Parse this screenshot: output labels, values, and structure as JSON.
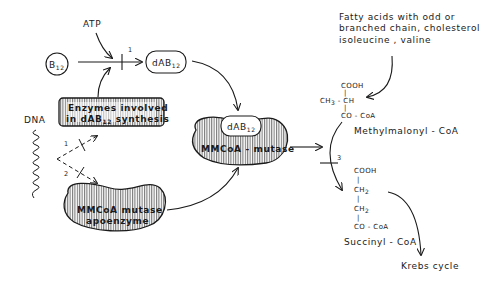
{
  "diagram": {
    "nodes": {
      "atp": {
        "label": "ATP"
      },
      "b12": {
        "label": "B",
        "sub": "12"
      },
      "dab12_top": {
        "label": "dAB",
        "sub": "12"
      },
      "enzymes": {
        "line1": "Enzymes involved",
        "line2_pre": "in dAB",
        "line2_sub": "12",
        "line2_post": " synthesis"
      },
      "dna": {
        "label": "DNA"
      },
      "mmcoa_mutase": {
        "label": "MMCoA - mutase",
        "cofactor": "dAB",
        "cofactor_sub": "12"
      },
      "apoenzyme": {
        "line1": "MMCoA  mutase",
        "line2": "apoenzyme"
      },
      "sources": {
        "line1": "Fatty acids  with odd or",
        "line2": "branched chain, cholesterol",
        "line3": "isoleucine , valine"
      },
      "methylmalonyl": {
        "name": "Methylmalonyl - CoA",
        "top": "COOH",
        "middle_left": "CH",
        "middle_left_sub": "3",
        "middle_dash": " - ",
        "middle_right": "CH",
        "bottom": "CO - CoA",
        "bond": "|"
      },
      "succinyl": {
        "name": "Succinyl - CoA",
        "top": "COOH",
        "mid1": "CH",
        "mid1_sub": "2",
        "mid2": "CH",
        "mid2_sub": "2",
        "bottom": "CO - CoA",
        "bond": "|"
      },
      "krebs": {
        "label": "Krebs  cycle"
      }
    },
    "step_numbers": {
      "step1_top": "1",
      "step1_dna": "1",
      "step2_dna": "2",
      "step3": "3"
    }
  }
}
